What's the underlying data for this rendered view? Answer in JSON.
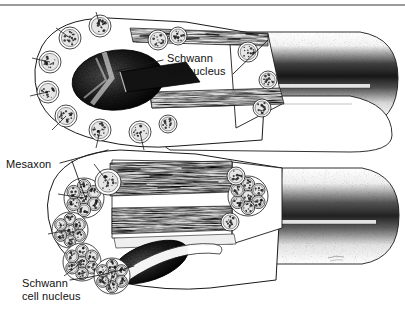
{
  "figure": {
    "background_color": "#ffffff",
    "ink_color": "#101010",
    "top_rule": {
      "visible": true,
      "y": 5,
      "color": "#3a3a3a"
    },
    "signature_mark": {
      "visible": true,
      "legible": false
    }
  },
  "labels": {
    "schwann_top": {
      "line1": "Schwann",
      "line2": "cell nucleus",
      "x": 167,
      "y": 52
    },
    "mesaxon": {
      "line1": "Mesaxon",
      "x": 6,
      "y": 158
    },
    "schwann_bottom": {
      "line1": "Schwann",
      "line2": "cell nucleus",
      "x": 22,
      "y": 277
    }
  },
  "leader_lines": [
    {
      "name": "schwann-top-leader",
      "from": [
        163,
        62
      ],
      "to": [
        112,
        72
      ]
    },
    {
      "name": "schwann-top-leader-right",
      "from": [
        232,
        72
      ],
      "to": [
        268,
        40
      ]
    },
    {
      "name": "mesaxon-leader-upper",
      "from": [
        60,
        163
      ],
      "to": [
        108,
        148
      ]
    },
    {
      "name": "mesaxon-leader-lower",
      "from": [
        60,
        166
      ],
      "to": [
        84,
        198
      ]
    },
    {
      "name": "schwann-bottom-leader",
      "from": [
        70,
        281
      ],
      "to": [
        132,
        268
      ]
    }
  ],
  "fibers": [
    {
      "name": "upper-fiber",
      "description": "Schwann cell enclosing many separate unmyelinated axons",
      "axon_arrangement": "individual",
      "cross_section_axon_count": 11,
      "nucleus": {
        "shape": "oval",
        "tone": "dark-stipple"
      },
      "cutaway": {
        "longitudinal_bands": 2
      }
    },
    {
      "name": "lower-fiber",
      "description": "Schwann cell enclosing clustered groups of unmyelinated axons",
      "axon_arrangement": "clustered",
      "cluster_count": 5,
      "axons_per_cluster": 7,
      "nucleus": {
        "shape": "elongated-oval",
        "tone": "dark-stipple"
      },
      "cutaway": {
        "longitudinal_bands": 2
      }
    }
  ]
}
